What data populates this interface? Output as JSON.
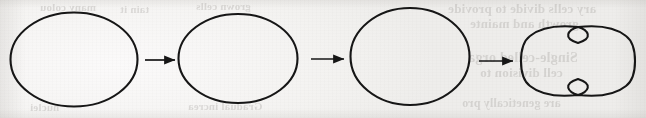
{
  "figure": {
    "caption": "",
    "background_color": "#f4f3f1",
    "ink_color": "#1a1a1a",
    "width": 646,
    "height": 118
  },
  "diagram": {
    "type": "process-sequence",
    "step_count": 4,
    "connector_count": 3,
    "stages": [
      {
        "index": 1,
        "name": "cell-stage-1",
        "shape": "ellipse",
        "label": "",
        "cx": 74,
        "cy": 59,
        "rx": 64,
        "ry": 47
      },
      {
        "index": 2,
        "name": "cell-stage-2",
        "shape": "ellipse",
        "label": "",
        "cx": 238,
        "cy": 59,
        "rx": 60,
        "ry": 45
      },
      {
        "index": 3,
        "name": "cell-stage-3",
        "shape": "ellipse",
        "label": "",
        "cx": 410,
        "cy": 57,
        "rx": 60,
        "ry": 49
      },
      {
        "index": 4,
        "name": "cell-stage-4-dividing",
        "shape": "dumbbell",
        "label": "",
        "cx": 578,
        "cy": 61,
        "rx": 60,
        "ry": 36
      }
    ],
    "connectors": [
      {
        "index": 1,
        "name": "arrow-1",
        "from": "cell-stage-1",
        "to": "cell-stage-2",
        "x1": 145,
        "x2": 176,
        "y": 60
      },
      {
        "index": 2,
        "name": "arrow-2",
        "from": "cell-stage-2",
        "to": "cell-stage-3",
        "x1": 311,
        "x2": 345,
        "y": 59
      },
      {
        "index": 3,
        "name": "arrow-3",
        "from": "cell-stage-3",
        "to": "cell-stage-4-dividing",
        "x1": 479,
        "x2": 514,
        "y": 61
      }
    ]
  },
  "showthrough": {
    "description": "Faint mirrored text bleeding through from the reverse side of the scanned page",
    "lines": [
      {
        "text": "ary cells divide to provide",
        "x": 448,
        "y": 1,
        "size": 13
      },
      {
        "text": "growth and mainte",
        "x": 470,
        "y": 16,
        "size": 13
      },
      {
        "text": "Single-celled orga",
        "x": 468,
        "y": 50,
        "size": 14
      },
      {
        "text": "cell division to",
        "x": 480,
        "y": 65,
        "size": 13
      },
      {
        "text": "are genetically pro",
        "x": 462,
        "y": 96,
        "size": 12
      },
      {
        "text": "many colou",
        "x": 40,
        "y": 1,
        "size": 11
      },
      {
        "text": "tain it",
        "x": 120,
        "y": 3,
        "size": 11
      },
      {
        "text": "grown cells",
        "x": 196,
        "y": 0,
        "size": 11
      },
      {
        "text": "Gradual increa",
        "x": 188,
        "y": 100,
        "size": 11
      },
      {
        "text": "nuclei",
        "x": 30,
        "y": 101,
        "size": 11
      }
    ]
  }
}
